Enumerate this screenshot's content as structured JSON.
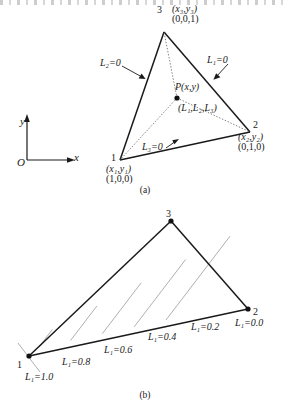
{
  "figure": {
    "panel_a": {
      "caption": "(a)",
      "axes": {
        "origin_label": "O",
        "x_label": "x",
        "y_label": "y"
      },
      "vertices": [
        {
          "number": "1",
          "coords": "(x₁,y₁)",
          "area_coords": "(1,0,0)"
        },
        {
          "number": "2",
          "coords": "(x₂,y₂)",
          "area_coords": "(0,1,0)"
        },
        {
          "number": "3",
          "coords": "(x₃,y₃)",
          "area_coords": "(0,0,1)"
        }
      ],
      "point": {
        "name": "P(x,y)",
        "area_coords": "(L₁,L₂,L₃)"
      },
      "edge_labels": [
        {
          "text": "L₁=0",
          "edge": "2-3"
        },
        {
          "text": "L₂=0",
          "edge": "1-3"
        },
        {
          "text": "L₃=0",
          "edge": "1-2"
        }
      ]
    },
    "panel_b": {
      "caption": "(b)",
      "vertices": [
        {
          "number": "1"
        },
        {
          "number": "2"
        },
        {
          "number": "3"
        }
      ],
      "contour_labels": [
        {
          "text": "L₁=1.0",
          "value": 1.0
        },
        {
          "text": "L₁=0.8",
          "value": 0.8
        },
        {
          "text": "L₁=0.6",
          "value": 0.6
        },
        {
          "text": "L₁=0.4",
          "value": 0.4
        },
        {
          "text": "L₁=0.2",
          "value": 0.2
        },
        {
          "text": "L₁=0.0",
          "value": 0.0
        }
      ]
    }
  },
  "colors": {
    "ink": "#1a1a1a",
    "thin_line": "#8f8f8f",
    "background": "#ffffff"
  }
}
